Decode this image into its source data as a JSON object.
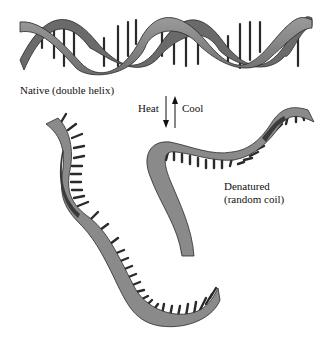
{
  "diagram": {
    "native_label": "Native (double helix)",
    "transition": {
      "heat_label": "Heat",
      "cool_label": "Cool",
      "heat_direction": "down",
      "cool_direction": "up"
    },
    "denatured_label_line1": "Denatured",
    "denatured_label_line2": "(random coil)",
    "colors": {
      "strand_fill": "#8a8a8a",
      "strand_dark": "#4a4a4a",
      "base_pair": "#2a2a2a",
      "text": "#111111",
      "background": "#ffffff"
    },
    "elements": [
      {
        "id": "double-helix",
        "description": "Two intertwined ribbon strands with base-pair rungs"
      },
      {
        "id": "single-strand-left",
        "description": "Separated single strand with bases, wavy"
      },
      {
        "id": "single-strand-right",
        "description": "Separated single strand with bases, S-shaped"
      }
    ]
  }
}
